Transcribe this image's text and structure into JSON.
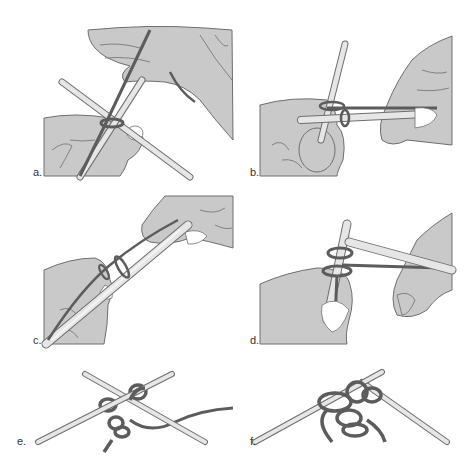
{
  "figure": {
    "colors": {
      "background": "#ffffff",
      "hand_fill": "#c9c9c9",
      "outline": "#6e6e6e",
      "needle_fill": "#d9d9d9",
      "needle_highlight": "#f2f2f2",
      "yarn": "#5c5c5c"
    },
    "panels": [
      {
        "id": "a",
        "label": "a.",
        "description": "Hands holding two crossed needles with yarn looped over the back needle"
      },
      {
        "id": "b",
        "label": "b.",
        "description": "Right needle inserted through loop on left needle, yarn wrapped"
      },
      {
        "id": "c",
        "label": "c.",
        "description": "Needles aligned diagonally with loop being slid"
      },
      {
        "id": "d",
        "label": "d.",
        "description": "Yarn wrapped around needle tip held by left hand"
      },
      {
        "id": "e",
        "label": "e.",
        "description": "Crossed needles with knotted yarn loops, yarn tail to the right"
      },
      {
        "id": "f",
        "label": "f.",
        "description": "Crossed needles with several yarn loops cast on"
      }
    ]
  }
}
